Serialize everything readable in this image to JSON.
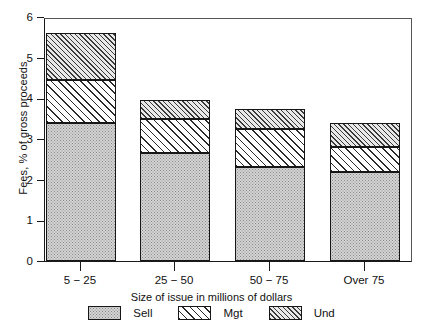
{
  "chart_data": {
    "type": "bar",
    "subtype": "stacked",
    "title": "",
    "xlabel": "Size of issue in millions of dollars",
    "ylabel": "Fees, % of gross proceeds",
    "categories": [
      "5 − 25",
      "25 − 50",
      "50 − 75",
      "Over 75"
    ],
    "series": [
      {
        "name": "Sell",
        "values": [
          3.4,
          2.65,
          2.3,
          2.2
        ]
      },
      {
        "name": "Mgt",
        "values": [
          1.05,
          0.85,
          0.95,
          0.6
        ]
      },
      {
        "name": "Und",
        "values": [
          1.15,
          0.45,
          0.5,
          0.6
        ]
      }
    ],
    "cumulative_tops": {
      "sell": [
        3.4,
        2.65,
        2.3,
        2.2
      ],
      "mgt": [
        4.45,
        3.5,
        3.25,
        2.8
      ],
      "und": [
        5.6,
        3.95,
        3.75,
        3.4
      ]
    },
    "totals": [
      5.6,
      3.95,
      3.75,
      3.4
    ],
    "ylim": [
      0,
      6
    ],
    "yticks": [
      0,
      1,
      2,
      3,
      4,
      5,
      6
    ],
    "ytick_labels": [
      "0",
      "1",
      "2",
      "3",
      "4",
      "5",
      "6"
    ],
    "grid": false,
    "legend_position": "bottom",
    "legend": [
      "Sell",
      "Mgt",
      "Und"
    ],
    "patterns": {
      "Sell": "dotted-stipple-gray",
      "Mgt": "diagonal-hatch-wide",
      "Und": "diagonal-hatch-dense"
    }
  },
  "axes": {
    "y_title": "Fees, % of gross proceeds",
    "x_title": "Size of issue in millions of dollars"
  },
  "legend_items": [
    {
      "label": "Sell",
      "swatch": "pat-sell"
    },
    {
      "label": "Mgt",
      "swatch": "pat-mgt"
    },
    {
      "label": "Und",
      "swatch": "pat-und"
    }
  ]
}
